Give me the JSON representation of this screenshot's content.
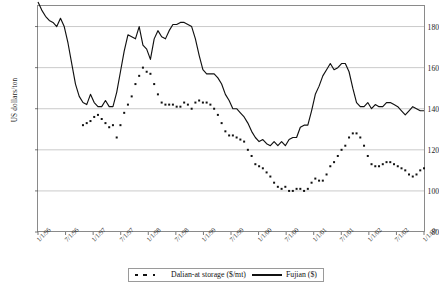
{
  "chart_data": {
    "type": "line",
    "title": "",
    "xlabel": "",
    "ylabel": "US dollars/ton",
    "ylim": [
      80,
      190
    ],
    "yticks": [
      80,
      100,
      120,
      140,
      160,
      180
    ],
    "grid": true,
    "legend_position": "bottom",
    "xtick_labels": [
      "1/1/96",
      "7/1/96",
      "1/1/97",
      "7/1/97",
      "1/1/98",
      "7/1/98",
      "1/1/99",
      "7/1/99",
      "1/1/00",
      "7/1/00",
      "1/1/01",
      "7/1/01",
      "1/1/02",
      "7/1/02",
      "1/1/03"
    ],
    "x_start": "1/1/96",
    "x_end": "1/1/03",
    "x_tick_interval_months": 6,
    "series": [
      {
        "name": "Fujian ($)",
        "style": "solid",
        "color": "#111111",
        "values": [
          192,
          188,
          185,
          183,
          182,
          180,
          184,
          180,
          172,
          162,
          152,
          146,
          143,
          142,
          147,
          143,
          141,
          141,
          144,
          141,
          141,
          148,
          158,
          168,
          176,
          175,
          174,
          180,
          171,
          169,
          164,
          174,
          178,
          175,
          174,
          178,
          181,
          181,
          182,
          182,
          181,
          180,
          174,
          166,
          159,
          157,
          157,
          157,
          155,
          152,
          147,
          144,
          140,
          140,
          138,
          136,
          133,
          129,
          126,
          124,
          125,
          123,
          122,
          124,
          122,
          124,
          122,
          125,
          126,
          126,
          131,
          132,
          132,
          139,
          147,
          151,
          156,
          159,
          162,
          159,
          160,
          162,
          162,
          158,
          150,
          143,
          141,
          141,
          143,
          140,
          142,
          141,
          141,
          143,
          143,
          142,
          141,
          139,
          137,
          139,
          141,
          140,
          139,
          139
        ]
      },
      {
        "name": "Dalian-at storage ($/mt)",
        "style": "dotted",
        "color": "#111111",
        "values": [
          null,
          null,
          null,
          null,
          null,
          null,
          null,
          null,
          null,
          null,
          null,
          null,
          132,
          133,
          134,
          136,
          137,
          135,
          133,
          131,
          132,
          126,
          132,
          138,
          142,
          146,
          152,
          156,
          160,
          158,
          157,
          152,
          147,
          143,
          142,
          142,
          142,
          141,
          141,
          143,
          142,
          140,
          143,
          144,
          143,
          143,
          142,
          140,
          137,
          133,
          129,
          127,
          127,
          126,
          125,
          124,
          120,
          117,
          113,
          112,
          111,
          109,
          107,
          104,
          102,
          101,
          102,
          100,
          100,
          101,
          101,
          100,
          101,
          104,
          106,
          105,
          105,
          108,
          112,
          114,
          117,
          120,
          122,
          126,
          128,
          128,
          126,
          122,
          117,
          113,
          112,
          112,
          113,
          114,
          114,
          113,
          112,
          111,
          110,
          108,
          107,
          108,
          110,
          111
        ]
      }
    ]
  },
  "axes": {
    "y_axis_label": "US dollars/ton",
    "y_tick_values": [
      "80",
      "100",
      "120",
      "140",
      "160",
      "180"
    ]
  },
  "legend": {
    "items": [
      {
        "label": "Dalian-at storage ($/mt)",
        "marker": "dotted"
      },
      {
        "label": "Fujian ($)",
        "marker": "solid"
      }
    ]
  },
  "colors": {
    "line": "#111111",
    "grid": "#bdbdbd",
    "frame": "#8a8a8a",
    "background": "#ffffff"
  }
}
